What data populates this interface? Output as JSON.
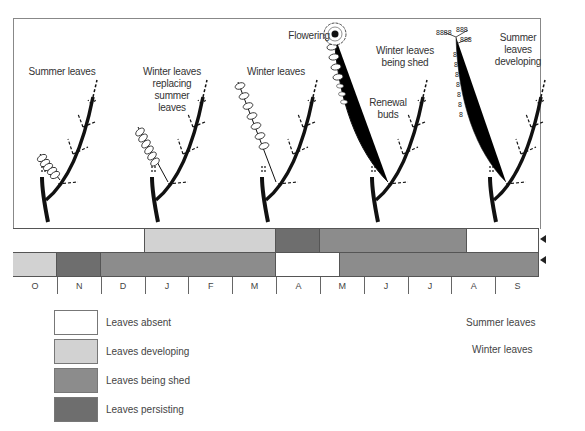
{
  "diagram": {
    "stages": [
      {
        "label": "Summer leaves"
      },
      {
        "label": "Winter leaves replacing summer leaves"
      },
      {
        "label": "Winter leaves"
      },
      {
        "label": "Winter leaves being shed"
      },
      {
        "label": "Summer leaves developing"
      }
    ],
    "annotations": {
      "flowering": "Flowering",
      "renewal_buds": "Renewal buds"
    },
    "labels_lines": {
      "stage1": [
        "Summer leaves"
      ],
      "stage2": [
        "Winter leaves",
        "replacing",
        "summer",
        "leaves"
      ],
      "stage3": [
        "Winter leaves"
      ],
      "stage4": [
        "Winter leaves",
        "being shed"
      ],
      "stage5": [
        "Summer",
        "leaves",
        "developing"
      ],
      "renewal": [
        "Renewal",
        "buds"
      ]
    }
  },
  "colors": {
    "absent": "#ffffff",
    "developing": "#d2d2d2",
    "being_shed": "#8c8c8c",
    "persisting": "#6e6e6e"
  },
  "timeline": {
    "months": [
      "O",
      "N",
      "D",
      "J",
      "F",
      "M",
      "A",
      "M",
      "J",
      "J",
      "A",
      "S"
    ],
    "rows": [
      {
        "name": "Summer leaves",
        "segments": [
          {
            "state": "absent",
            "from": 0,
            "to": 3
          },
          {
            "state": "developing",
            "from": 3,
            "to": 6
          },
          {
            "state": "persisting",
            "from": 6,
            "to": 7
          },
          {
            "state": "being_shed",
            "from": 7,
            "to": 10.35
          },
          {
            "state": "absent",
            "from": 10.35,
            "to": 12
          }
        ]
      },
      {
        "name": "Winter leaves",
        "segments": [
          {
            "state": "developing",
            "from": 0,
            "to": 1
          },
          {
            "state": "persisting",
            "from": 1,
            "to": 2
          },
          {
            "state": "being_shed",
            "from": 2,
            "to": 6
          },
          {
            "state": "absent",
            "from": 6,
            "to": 7.45
          },
          {
            "state": "being_shed",
            "from": 7.45,
            "to": 12
          }
        ]
      }
    ]
  },
  "legend": [
    {
      "state": "absent",
      "label": "Leaves absent"
    },
    {
      "state": "developing",
      "label": "Leaves developing"
    },
    {
      "state": "being_shed",
      "label": "Leaves being shed"
    },
    {
      "state": "persisting",
      "label": "Leaves persisting"
    }
  ],
  "row_labels": {
    "summer": "Summer leaves",
    "winter": "Winter leaves"
  }
}
